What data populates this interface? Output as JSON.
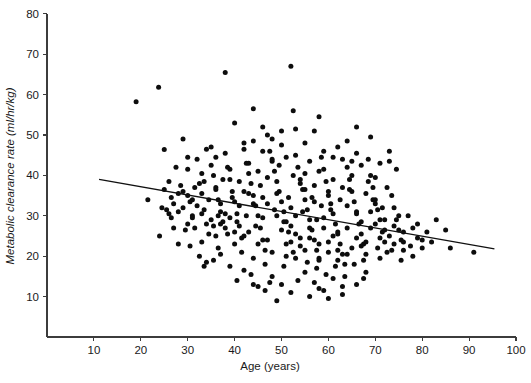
{
  "chart_data": {
    "type": "scatter",
    "title": "",
    "xlabel": "Age (years)",
    "ylabel": "Metabolic clearance rate (ml/hr/kg)",
    "xlim": [
      0,
      100
    ],
    "ylim": [
      0,
      80
    ],
    "xticks": [
      10,
      20,
      30,
      40,
      50,
      60,
      70,
      80,
      90,
      100
    ],
    "yticks": [
      10,
      20,
      30,
      40,
      50,
      60,
      70,
      80
    ],
    "grid": false,
    "legend": null,
    "point_color": "#0d0d0d",
    "point_size_px": 5,
    "trendline": {
      "label": "linear regression fit",
      "color": "#111111",
      "x_start": 11.1,
      "y_start": 39.0,
      "x_end": 95.4,
      "y_end": 21.8,
      "slope": -0.204,
      "intercept": 41.3
    },
    "n_points": 316,
    "points": [
      [
        19.0,
        58.2
      ],
      [
        23.8,
        61.8
      ],
      [
        25.0,
        46.4
      ],
      [
        21.5,
        34.0
      ],
      [
        24.5,
        32.0
      ],
      [
        26.0,
        38.5
      ],
      [
        27.0,
        33.0
      ],
      [
        28.0,
        31.0
      ],
      [
        26.5,
        29.5
      ],
      [
        29.0,
        36.0
      ],
      [
        30.0,
        41.5
      ],
      [
        30.5,
        33.5
      ],
      [
        31.0,
        30.0
      ],
      [
        31.5,
        27.0
      ],
      [
        32.0,
        44.0
      ],
      [
        32.5,
        38.0
      ],
      [
        33.0,
        35.5
      ],
      [
        33.5,
        31.5
      ],
      [
        34.0,
        28.0
      ],
      [
        34.5,
        25.5
      ],
      [
        35.0,
        47.0
      ],
      [
        35.5,
        40.0
      ],
      [
        36.0,
        37.0
      ],
      [
        36.5,
        34.0
      ],
      [
        37.0,
        31.0
      ],
      [
        37.5,
        28.5
      ],
      [
        38.0,
        45.5
      ],
      [
        38.5,
        42.0
      ],
      [
        39.0,
        39.0
      ],
      [
        39.5,
        36.0
      ],
      [
        40.0,
        33.5
      ],
      [
        40.5,
        30.5
      ],
      [
        41.0,
        27.5
      ],
      [
        41.5,
        24.5
      ],
      [
        42.0,
        48.0
      ],
      [
        42.5,
        43.0
      ],
      [
        43.0,
        40.5
      ],
      [
        43.5,
        38.0
      ],
      [
        44.0,
        35.0
      ],
      [
        44.5,
        32.5
      ],
      [
        45.0,
        30.0
      ],
      [
        45.5,
        27.0
      ],
      [
        46.0,
        24.0
      ],
      [
        46.5,
        21.5
      ],
      [
        47.0,
        50.0
      ],
      [
        47.5,
        46.0
      ],
      [
        48.0,
        43.5
      ],
      [
        48.5,
        41.0
      ],
      [
        49.0,
        38.5
      ],
      [
        49.5,
        36.0
      ],
      [
        50.0,
        33.5
      ],
      [
        50.5,
        31.0
      ],
      [
        51.0,
        28.5
      ],
      [
        51.5,
        26.0
      ],
      [
        52.0,
        23.5
      ],
      [
        52.5,
        21.0
      ],
      [
        52.0,
        67.0
      ],
      [
        53.0,
        45.0
      ],
      [
        53.5,
        42.0
      ],
      [
        54.0,
        39.0
      ],
      [
        54.5,
        36.5
      ],
      [
        55.0,
        34.0
      ],
      [
        55.5,
        31.5
      ],
      [
        56.0,
        29.0
      ],
      [
        56.5,
        26.5
      ],
      [
        57.0,
        24.0
      ],
      [
        57.5,
        21.5
      ],
      [
        58.0,
        19.0
      ],
      [
        58.5,
        44.5
      ],
      [
        59.0,
        41.5
      ],
      [
        59.5,
        38.5
      ],
      [
        60.0,
        36.0
      ],
      [
        60.5,
        33.0
      ],
      [
        61.0,
        30.5
      ],
      [
        61.5,
        28.0
      ],
      [
        62.0,
        25.5
      ],
      [
        62.5,
        23.0
      ],
      [
        63.0,
        20.5
      ],
      [
        63.5,
        18.0
      ],
      [
        64.0,
        42.0
      ],
      [
        64.5,
        39.0
      ],
      [
        65.0,
        36.0
      ],
      [
        65.5,
        33.5
      ],
      [
        66.0,
        31.0
      ],
      [
        66.5,
        28.0
      ],
      [
        67.0,
        25.5
      ],
      [
        67.5,
        23.0
      ],
      [
        68.0,
        20.5
      ],
      [
        68.5,
        44.0
      ],
      [
        69.0,
        40.0
      ],
      [
        69.5,
        37.0
      ],
      [
        70.0,
        34.0
      ],
      [
        70.5,
        31.5
      ],
      [
        71.0,
        29.0
      ],
      [
        71.5,
        26.0
      ],
      [
        72.0,
        23.5
      ],
      [
        72.5,
        21.0
      ],
      [
        73.0,
        43.5
      ],
      [
        73.5,
        35.0
      ],
      [
        74.0,
        32.0
      ],
      [
        74.5,
        29.0
      ],
      [
        75.0,
        26.5
      ],
      [
        75.5,
        24.0
      ],
      [
        76.0,
        21.5
      ],
      [
        77.0,
        30.0
      ],
      [
        78.0,
        27.0
      ],
      [
        79.0,
        24.5
      ],
      [
        80.0,
        22.0
      ],
      [
        81.0,
        26.0
      ],
      [
        83.0,
        29.0
      ],
      [
        85.0,
        26.5
      ],
      [
        91.0,
        21.0
      ],
      [
        38.0,
        65.5
      ],
      [
        44.0,
        56.5
      ],
      [
        40.0,
        53.0
      ],
      [
        46.0,
        52.0
      ],
      [
        53.0,
        51.5
      ],
      [
        57.0,
        51.0
      ],
      [
        66.0,
        52.0
      ],
      [
        69.0,
        49.5
      ],
      [
        29.0,
        49.0
      ],
      [
        34.0,
        46.5
      ],
      [
        50.0,
        47.5
      ],
      [
        59.0,
        46.0
      ],
      [
        62.0,
        47.0
      ],
      [
        73.0,
        46.0
      ],
      [
        27.5,
        42.0
      ],
      [
        48.0,
        44.0
      ],
      [
        51.0,
        44.5
      ],
      [
        63.0,
        44.0
      ],
      [
        71.0,
        43.0
      ],
      [
        35.0,
        42.5
      ],
      [
        43.0,
        43.0
      ],
      [
        56.0,
        43.5
      ],
      [
        67.0,
        42.5
      ],
      [
        33.0,
        40.5
      ],
      [
        39.0,
        41.5
      ],
      [
        45.0,
        41.0
      ],
      [
        58.0,
        41.0
      ],
      [
        65.0,
        40.0
      ],
      [
        28.5,
        37.5
      ],
      [
        41.0,
        38.5
      ],
      [
        47.0,
        39.5
      ],
      [
        54.0,
        38.0
      ],
      [
        61.0,
        39.0
      ],
      [
        30.0,
        35.0
      ],
      [
        36.0,
        36.5
      ],
      [
        42.0,
        36.0
      ],
      [
        49.0,
        35.5
      ],
      [
        55.0,
        36.5
      ],
      [
        60.0,
        35.0
      ],
      [
        68.0,
        35.5
      ],
      [
        32.0,
        32.5
      ],
      [
        37.0,
        33.0
      ],
      [
        44.0,
        33.0
      ],
      [
        52.0,
        32.0
      ],
      [
        57.0,
        33.5
      ],
      [
        64.0,
        32.5
      ],
      [
        70.0,
        33.0
      ],
      [
        26.0,
        30.5
      ],
      [
        31.0,
        29.5
      ],
      [
        38.0,
        30.5
      ],
      [
        46.0,
        29.5
      ],
      [
        53.0,
        30.0
      ],
      [
        59.0,
        29.5
      ],
      [
        66.0,
        30.5
      ],
      [
        72.0,
        29.0
      ],
      [
        29.5,
        26.5
      ],
      [
        35.5,
        27.5
      ],
      [
        43.0,
        26.0
      ],
      [
        50.0,
        26.5
      ],
      [
        56.0,
        27.0
      ],
      [
        62.0,
        26.0
      ],
      [
        69.0,
        27.0
      ],
      [
        76.0,
        26.0
      ],
      [
        33.0,
        23.5
      ],
      [
        40.0,
        23.0
      ],
      [
        47.0,
        24.0
      ],
      [
        54.0,
        22.5
      ],
      [
        60.0,
        23.5
      ],
      [
        67.0,
        22.5
      ],
      [
        74.0,
        23.0
      ],
      [
        80.0,
        24.0
      ],
      [
        37.0,
        20.5
      ],
      [
        44.0,
        19.5
      ],
      [
        51.0,
        20.0
      ],
      [
        58.0,
        19.5
      ],
      [
        64.0,
        20.5
      ],
      [
        71.0,
        19.5
      ],
      [
        78.0,
        20.0
      ],
      [
        42.0,
        16.5
      ],
      [
        48.0,
        15.0
      ],
      [
        55.0,
        16.0
      ],
      [
        61.0,
        14.5
      ],
      [
        68.0,
        16.0
      ],
      [
        45.0,
        12.5
      ],
      [
        52.0,
        11.0
      ],
      [
        58.0,
        12.0
      ],
      [
        63.0,
        10.5
      ],
      [
        66.0,
        13.0
      ],
      [
        49.0,
        9.0
      ],
      [
        56.0,
        10.0
      ],
      [
        60.0,
        9.5
      ],
      [
        25.5,
        31.5
      ],
      [
        27.0,
        27.0
      ],
      [
        24.0,
        25.0
      ],
      [
        28.0,
        23.0
      ],
      [
        30.5,
        22.5
      ],
      [
        32.5,
        20.0
      ],
      [
        34.0,
        18.5
      ],
      [
        36.5,
        22.0
      ],
      [
        39.0,
        17.5
      ],
      [
        41.5,
        21.0
      ],
      [
        43.5,
        15.5
      ],
      [
        46.5,
        18.0
      ],
      [
        47.5,
        13.5
      ],
      [
        50.5,
        17.5
      ],
      [
        53.5,
        14.0
      ],
      [
        55.5,
        18.5
      ],
      [
        57.5,
        17.0
      ],
      [
        59.5,
        15.5
      ],
      [
        61.5,
        17.5
      ],
      [
        63.5,
        15.0
      ],
      [
        65.5,
        18.0
      ],
      [
        67.5,
        19.0
      ],
      [
        70.5,
        22.0
      ],
      [
        73.5,
        21.5
      ],
      [
        75.5,
        19.0
      ],
      [
        77.5,
        22.5
      ],
      [
        36.0,
        25.0
      ],
      [
        38.5,
        25.5
      ],
      [
        40.5,
        28.5
      ],
      [
        42.5,
        30.0
      ],
      [
        44.5,
        27.5
      ],
      [
        48.5,
        31.5
      ],
      [
        51.5,
        34.5
      ],
      [
        54.5,
        31.0
      ],
      [
        56.5,
        34.5
      ],
      [
        58.5,
        32.5
      ],
      [
        60.5,
        31.5
      ],
      [
        62.5,
        34.0
      ],
      [
        64.5,
        36.5
      ],
      [
        69.5,
        34.0
      ],
      [
        71.5,
        32.0
      ],
      [
        31.5,
        37.0
      ],
      [
        33.5,
        38.5
      ],
      [
        37.5,
        39.0
      ],
      [
        39.5,
        34.5
      ],
      [
        45.5,
        37.5
      ],
      [
        49.5,
        42.5
      ],
      [
        52.5,
        40.0
      ],
      [
        55.0,
        40.5
      ],
      [
        57.0,
        37.5
      ],
      [
        63.0,
        37.0
      ],
      [
        65.0,
        43.5
      ],
      [
        68.5,
        38.5
      ],
      [
        70.0,
        39.5
      ],
      [
        72.5,
        37.0
      ],
      [
        29.0,
        32.0
      ],
      [
        30.0,
        28.0
      ],
      [
        34.5,
        34.0
      ],
      [
        36.5,
        30.0
      ],
      [
        38.0,
        27.0
      ],
      [
        41.0,
        32.5
      ],
      [
        43.0,
        35.5
      ],
      [
        46.0,
        34.5
      ],
      [
        47.0,
        33.0
      ],
      [
        49.0,
        30.0
      ],
      [
        50.5,
        28.5
      ],
      [
        52.0,
        27.5
      ],
      [
        53.0,
        25.5
      ],
      [
        54.0,
        24.5
      ],
      [
        56.0,
        24.5
      ],
      [
        57.5,
        29.0
      ],
      [
        59.0,
        27.0
      ],
      [
        61.0,
        25.0
      ],
      [
        62.0,
        21.5
      ],
      [
        64.0,
        27.0
      ],
      [
        66.0,
        24.5
      ],
      [
        67.0,
        28.5
      ],
      [
        69.0,
        31.0
      ],
      [
        70.0,
        28.0
      ],
      [
        72.0,
        26.5
      ],
      [
        74.0,
        27.5
      ],
      [
        75.0,
        30.0
      ],
      [
        79.0,
        28.0
      ],
      [
        82.0,
        23.5
      ],
      [
        86.0,
        22.0
      ],
      [
        26.5,
        34.5
      ],
      [
        28.0,
        35.5
      ],
      [
        31.0,
        34.0
      ],
      [
        33.0,
        30.5
      ],
      [
        35.0,
        29.0
      ],
      [
        37.0,
        28.0
      ],
      [
        39.0,
        29.5
      ],
      [
        40.0,
        26.0
      ],
      [
        42.0,
        25.0
      ],
      [
        45.0,
        23.0
      ],
      [
        48.0,
        21.0
      ],
      [
        51.0,
        23.0
      ],
      [
        53.0,
        19.5
      ],
      [
        55.0,
        21.5
      ],
      [
        58.0,
        23.0
      ],
      [
        60.0,
        21.0
      ],
      [
        62.0,
        19.0
      ],
      [
        65.0,
        22.0
      ],
      [
        68.0,
        23.5
      ],
      [
        71.0,
        24.5
      ],
      [
        73.0,
        25.0
      ],
      [
        76.0,
        23.5
      ],
      [
        44.0,
        48.5
      ],
      [
        48.0,
        49.0
      ],
      [
        55.0,
        48.0
      ],
      [
        61.0,
        44.5
      ],
      [
        64.0,
        48.5
      ],
      [
        52.5,
        56.0
      ],
      [
        58.0,
        54.5
      ],
      [
        36.0,
        44.5
      ],
      [
        30.0,
        44.5
      ],
      [
        25.0,
        36.5
      ],
      [
        46.0,
        46.0
      ],
      [
        42.0,
        46.5
      ],
      [
        50.0,
        51.0
      ],
      [
        66.0,
        45.5
      ],
      [
        74.5,
        41.5
      ],
      [
        35.5,
        19.0
      ],
      [
        40.5,
        14.0
      ],
      [
        46.5,
        11.5
      ],
      [
        57.0,
        13.5
      ],
      [
        63.0,
        12.5
      ],
      [
        59.0,
        11.5
      ],
      [
        67.5,
        14.5
      ],
      [
        33.5,
        17.5
      ],
      [
        44.0,
        13.0
      ],
      [
        50.0,
        13.0
      ]
    ]
  }
}
